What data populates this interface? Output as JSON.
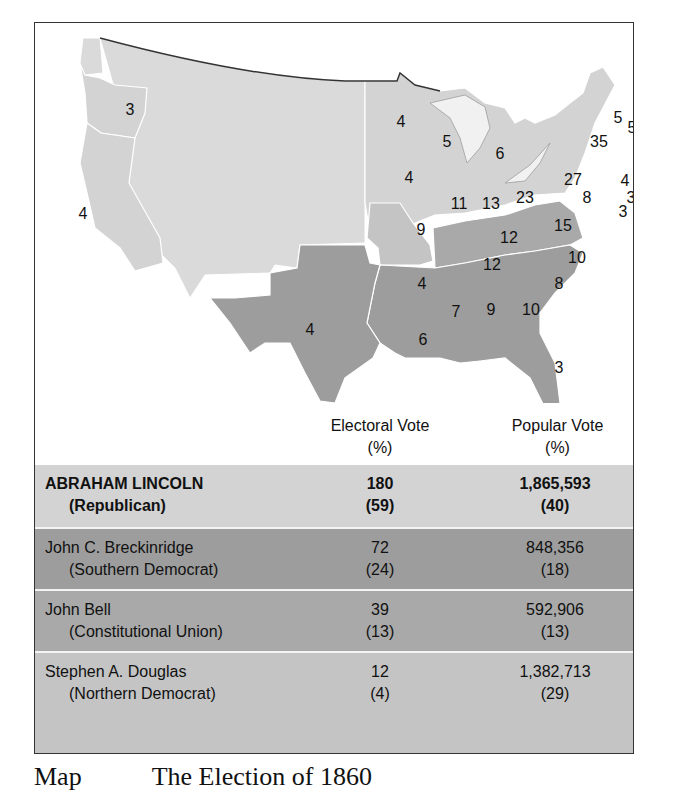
{
  "map": {
    "colors": {
      "lincoln": "#d3d3d3",
      "territory": "#dadada",
      "breckinridge": "#9d9d9d",
      "bell": "#a9a9a9",
      "douglas": "#c4c4c4",
      "border": "#ffffff",
      "outline": "#333333"
    },
    "state_labels": [
      {
        "id": "OR",
        "value": "3",
        "x": 95,
        "y": 92
      },
      {
        "id": "CA",
        "value": "4",
        "x": 48,
        "y": 190
      },
      {
        "id": "MN",
        "value": "4",
        "x": 32,
        "y": 104
      },
      {
        "id": "WI",
        "value": "5",
        "x": 147,
        "y": 123
      },
      {
        "id": "MI",
        "value": "6",
        "x": 199,
        "y": 135
      },
      {
        "id": "IA",
        "value": "4",
        "x": 40,
        "y": 159
      },
      {
        "id": "IL",
        "value": "11",
        "x": 90,
        "y": 186
      },
      {
        "id": "IN",
        "value": "13",
        "x": 122,
        "y": 185
      },
      {
        "id": "OH",
        "value": "23",
        "x": 158,
        "y": 178
      },
      {
        "id": "PA",
        "value": "27",
        "x": 212,
        "y": 162
      },
      {
        "id": "NY",
        "value": "35",
        "x": 232,
        "y": 124
      },
      {
        "id": "VT",
        "value": "5",
        "x": 251,
        "y": 104
      },
      {
        "id": "NH",
        "value": "5",
        "x": 264,
        "y": 109
      },
      {
        "id": "ME",
        "value": "8",
        "x": 281,
        "y": 75
      },
      {
        "id": "MA",
        "value": "13",
        "x": 290,
        "y": 119
      },
      {
        "id": "RI",
        "value": "4",
        "x": 290,
        "y": 148
      },
      {
        "id": "CT",
        "value": "6",
        "x": 274,
        "y": 157
      },
      {
        "id": "NJ",
        "value": "4",
        "x": 259,
        "y": 160
      },
      {
        "id": "DE",
        "value": "3",
        "x": 264,
        "y": 174
      },
      {
        "id": "MD",
        "value": "8",
        "x": 222,
        "y": 178
      },
      {
        "id": "MD2",
        "value": "3",
        "x": 256,
        "y": 188
      },
      {
        "id": "MO",
        "value": "9",
        "x": 55,
        "y": 211
      },
      {
        "id": "KY",
        "value": "12",
        "x": 143,
        "y": 217
      },
      {
        "id": "VA",
        "value": "15",
        "x": 199,
        "y": 207
      },
      {
        "id": "TN",
        "value": "12",
        "x": 257,
        "y": 263
      },
      {
        "id": "NC",
        "value": "10",
        "x": 342,
        "y": 261
      },
      {
        "id": "AR",
        "value": "4",
        "x": 187,
        "y": 286
      },
      {
        "id": "SC",
        "value": "8",
        "x": 324,
        "y": 288
      },
      {
        "id": "MS",
        "value": "7",
        "x": 221,
        "y": 314
      },
      {
        "id": "AL",
        "value": "9",
        "x": 256,
        "y": 311
      },
      {
        "id": "GA",
        "value": "10",
        "x": 296,
        "y": 311
      },
      {
        "id": "TX",
        "value": "4",
        "x": 109,
        "y": 334
      },
      {
        "id": "LA",
        "value": "6",
        "x": 188,
        "y": 343
      },
      {
        "id": "FL",
        "value": "3",
        "x": 324,
        "y": 369
      }
    ]
  },
  "table": {
    "headers": {
      "electoral_line1": "Electoral Vote",
      "electoral_line2": "(%)",
      "popular_line1": "Popular Vote",
      "popular_line2": "(%)"
    },
    "rows": [
      {
        "name": "ABRAHAM LINCOLN",
        "party": "(Republican)",
        "ev": "180",
        "ev_pct": "(59)",
        "pv": "1,865,593",
        "pv_pct": "(40)",
        "bg": "#d3d3d3"
      },
      {
        "name": "John C. Breckinridge",
        "party": "(Southern Democrat)",
        "ev": "72",
        "ev_pct": "(24)",
        "pv": "848,356",
        "pv_pct": "(18)",
        "bg": "#9d9d9d"
      },
      {
        "name": "John Bell",
        "party": "(Constitutional Union)",
        "ev": "39",
        "ev_pct": "(13)",
        "pv": "592,906",
        "pv_pct": "(13)",
        "bg": "#a9a9a9"
      },
      {
        "name": "Stephen A. Douglas",
        "party": "(Northern Democrat)",
        "ev": "12",
        "ev_pct": "(4)",
        "pv": "1,382,713",
        "pv_pct": "(29)",
        "bg": "#c4c4c4"
      }
    ]
  },
  "caption": {
    "prefix": "Map",
    "text": "The Election of 1860"
  }
}
